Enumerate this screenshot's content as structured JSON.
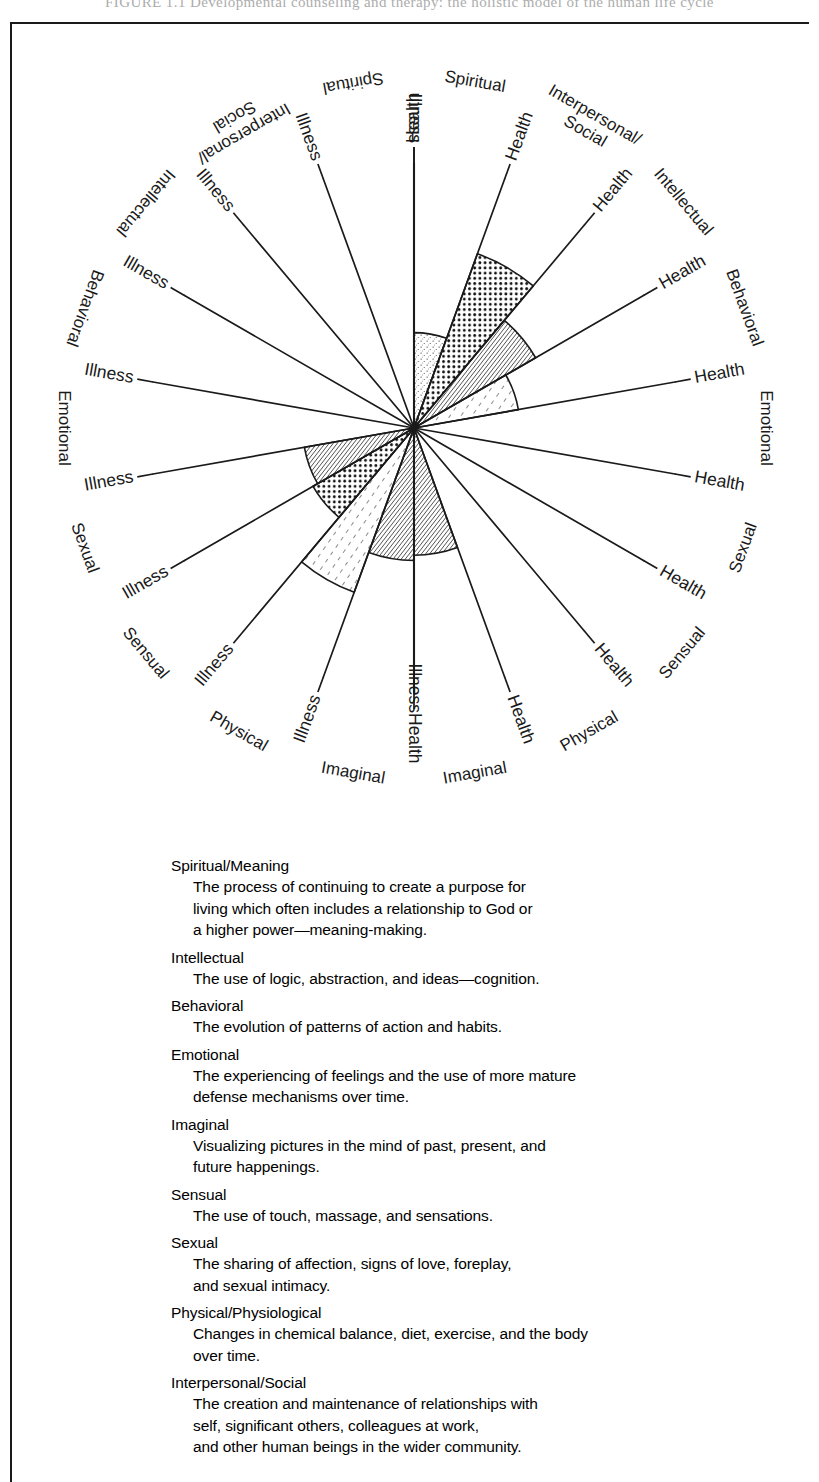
{
  "running_head": "FIGURE 1.1    Developmental counseling and therapy: the holistic model of the human life cycle",
  "wheel": {
    "center_x": 414,
    "center_y": 406,
    "radius": 265,
    "health_label": "Health",
    "illness_label": "Illness",
    "dimensions_right": [
      "Spiritual",
      "Interpersonal/\nSocial",
      "Intellectual",
      "Behavioral",
      "Emotional",
      "Sexual",
      "Sensual",
      "Physical",
      "Imaginal"
    ],
    "dimensions_left": [
      "Imaginal",
      "Physical",
      "Sensual",
      "Sexual",
      "Emotional",
      "Behavioral",
      "Intellectual",
      "Interpersonal/\nSocial",
      "Spiritual"
    ],
    "spoke_count": 18,
    "outer_labels": [
      {
        "text": "Spiritual",
        "side": "right",
        "index": 0
      },
      {
        "text": "Interpersonal/",
        "side": "right",
        "index": 1
      },
      {
        "text": "Social",
        "side": "right",
        "index": 1
      },
      {
        "text": "Intellectual",
        "side": "right",
        "index": 2
      },
      {
        "text": "Behavioral",
        "side": "right",
        "index": 3
      },
      {
        "text": "Emotional",
        "side": "right",
        "index": 4
      },
      {
        "text": "Sexual",
        "side": "right",
        "index": 5
      },
      {
        "text": "Sensual",
        "side": "right",
        "index": 6
      },
      {
        "text": "Physical",
        "side": "right",
        "index": 7
      },
      {
        "text": "Imaginal",
        "side": "right",
        "index": 8
      },
      {
        "text": "Imaginal",
        "side": "left",
        "index": 0
      },
      {
        "text": "Physical",
        "side": "left",
        "index": 1
      },
      {
        "text": "Sensual",
        "side": "left",
        "index": 2
      },
      {
        "text": "Sexual",
        "side": "left",
        "index": 3
      },
      {
        "text": "Emotional",
        "side": "left",
        "index": 4
      },
      {
        "text": "Behavioral",
        "side": "left",
        "index": 5
      },
      {
        "text": "Intellectual",
        "side": "left",
        "index": 6
      },
      {
        "text": "Interpersonal/",
        "side": "left",
        "index": 7
      },
      {
        "text": "Social",
        "side": "left",
        "index": 7
      },
      {
        "text": "Spiritual",
        "side": "left",
        "index": 8
      }
    ],
    "shaded_wedges": [
      {
        "sector": "illness-spiritual-upper",
        "pattern": "dense-hatch",
        "extent": 0.5
      },
      {
        "sector": "illness-imaginal",
        "pattern": "sparse-hatch",
        "extent": 0.66
      },
      {
        "sector": "illness-physical",
        "pattern": "dot-grid",
        "extent": 0.44
      },
      {
        "sector": "illness-sensual",
        "pattern": "dense-hatch",
        "extent": 0.42
      },
      {
        "sector": "health-spiritual",
        "pattern": "fine-stipple",
        "extent": 0.36
      },
      {
        "sector": "health-interpersonal",
        "pattern": "dot-grid",
        "extent": 0.7
      },
      {
        "sector": "health-intellectual",
        "pattern": "dense-hatch",
        "extent": 0.53
      },
      {
        "sector": "health-behavioral",
        "pattern": "sparse-hatch",
        "extent": 0.4
      },
      {
        "sector": "illness-spiritual-lower",
        "pattern": "dense-hatch",
        "extent": 0.48
      }
    ]
  },
  "legend": {
    "entries": [
      {
        "title": "Spiritual/Meaning",
        "lines": [
          "The process of continuing to create a purpose for",
          "living which often includes a relationship to God or",
          "a higher power—meaning-making."
        ]
      },
      {
        "title": "Intellectual",
        "lines": [
          "The use of logic, abstraction, and ideas—cognition."
        ]
      },
      {
        "title": "Behavioral",
        "lines": [
          "The evolution of patterns of action and habits."
        ]
      },
      {
        "title": "Emotional",
        "lines": [
          "The experiencing of feelings and the use of more mature",
          "defense mechanisms over time."
        ]
      },
      {
        "title": "Imaginal",
        "lines": [
          "Visualizing pictures in the mind of past, present, and",
          "future happenings."
        ]
      },
      {
        "title": "Sensual",
        "lines": [
          "The use of touch, massage, and sensations."
        ]
      },
      {
        "title": "Sexual",
        "lines": [
          "The sharing of affection, signs of love, foreplay,",
          "and sexual intimacy."
        ]
      },
      {
        "title": "Physical/Physiological",
        "lines": [
          "Changes in chemical balance, diet, exercise, and the body",
          "over time."
        ]
      },
      {
        "title": "Interpersonal/Social",
        "lines": [
          "The creation and maintenance of relationships with",
          "self, significant others, colleagues at work,",
          "and other human beings in the wider community."
        ]
      }
    ]
  },
  "colors": {
    "ink": "#1a1a1a",
    "paper": "#ffffff",
    "running_head": "#8c8c8c"
  }
}
